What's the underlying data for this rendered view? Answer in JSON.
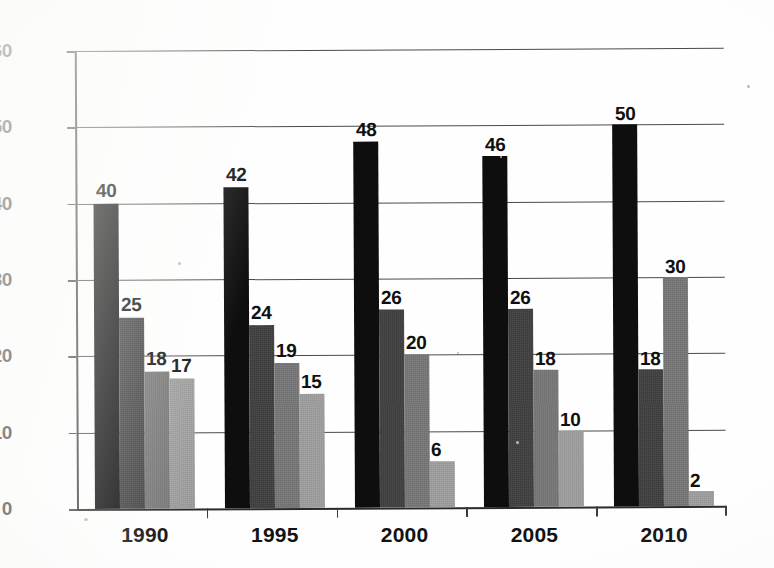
{
  "chart_data": {
    "type": "bar",
    "title": "",
    "subtitle": "",
    "xlabel": "",
    "ylabel": "",
    "categories": [
      "1990",
      "1995",
      "2000",
      "2005",
      "2010"
    ],
    "series": [
      {
        "name": "series-1",
        "color": "#0e0e0e",
        "values": [
          40,
          42,
          48,
          46,
          50
        ]
      },
      {
        "name": "series-2",
        "color": "#3a3a3a",
        "values": [
          25,
          24,
          26,
          26,
          18
        ]
      },
      {
        "name": "series-3",
        "color": "#6e6e6e",
        "values": [
          18,
          19,
          20,
          18,
          30
        ]
      },
      {
        "name": "series-4",
        "color": "#949494",
        "values": [
          17,
          15,
          6,
          10,
          2
        ]
      }
    ],
    "ylim": [
      0,
      60
    ],
    "yticks": [
      0,
      10,
      20,
      30,
      40,
      50,
      60
    ],
    "ytick_labels": [
      "0",
      "10",
      "20",
      "30",
      "40",
      "50",
      "60"
    ],
    "grid": true,
    "grid_axis": "y",
    "legend": false,
    "legend_position": "none",
    "data_labels": true,
    "data_label_values": [
      [
        "40",
        "25",
        "18",
        "17"
      ],
      [
        "42",
        "24",
        "19",
        "15"
      ],
      [
        "48",
        "26",
        "20",
        "6"
      ],
      [
        "46",
        "26",
        "18",
        "10"
      ],
      [
        "50",
        "18",
        "30",
        "2"
      ]
    ],
    "annotations": []
  },
  "axes": {
    "y_tick_labels": [
      "60",
      "50",
      "40",
      "30",
      "20",
      "10",
      "0"
    ],
    "x_tick_labels": [
      "1990",
      "1995",
      "2000",
      "2005",
      "2010"
    ]
  }
}
